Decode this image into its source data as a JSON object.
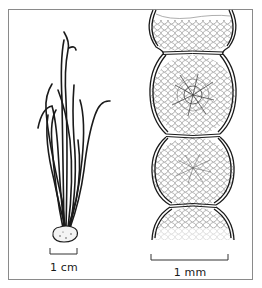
{
  "figure": {
    "panels": [
      {
        "id": "left",
        "subject": "tufted filamentous alga habit with holdfast",
        "scale_bar": {
          "label": "1 cm"
        }
      },
      {
        "id": "right",
        "subject": "magnified chain of rounded cells with granular contents",
        "scale_bar": {
          "label": "1 mm"
        }
      }
    ],
    "colors": {
      "ink": "#1a1a1a",
      "frame": "#8a8a8a",
      "background": "#ffffff"
    }
  }
}
